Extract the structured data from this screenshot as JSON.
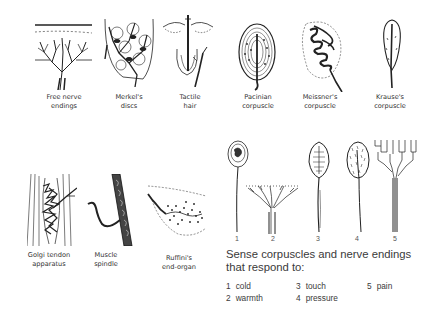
{
  "top_row": [
    {
      "id": "free-nerve-endings",
      "line1": "Free nerve",
      "line2": "endings"
    },
    {
      "id": "merkels-discs",
      "line1": "Merkel's",
      "line2": "discs"
    },
    {
      "id": "tactile-hair",
      "line1": "Tactile",
      "line2": "hair"
    },
    {
      "id": "pacinian-corpuscle",
      "line1": "Pacinian",
      "line2": "corpuscle"
    },
    {
      "id": "meissners-corpuscle",
      "line1": "Meissner's",
      "line2": "corpuscle"
    },
    {
      "id": "krauses-corpuscle",
      "line1": "Krause's",
      "line2": "corpuscle"
    }
  ],
  "bottom_row": [
    {
      "id": "golgi-tendon-apparatus",
      "line1": "Golgi tendon",
      "line2": "apparatus"
    },
    {
      "id": "muscle-spindle",
      "line1": "Muscle",
      "line2": "spindle"
    },
    {
      "id": "ruffinis-end-organ",
      "line1": "Ruffini's",
      "line2": "end-organ"
    }
  ],
  "numbered_receptors": [
    "1",
    "2",
    "3",
    "4",
    "5"
  ],
  "caption": {
    "line1": "Sense corpuscles and nerve endings",
    "line2": "that respond to:"
  },
  "legend": [
    {
      "num": "1",
      "label": "cold"
    },
    {
      "num": "2",
      "label": "warmth"
    },
    {
      "num": "3",
      "label": "touch"
    },
    {
      "num": "4",
      "label": "pressure"
    },
    {
      "num": "5",
      "label": "pain"
    }
  ]
}
